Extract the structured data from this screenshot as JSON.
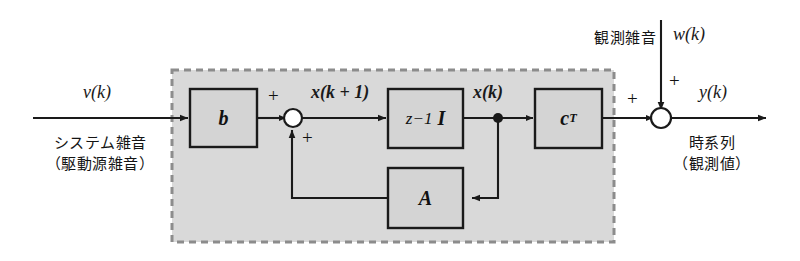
{
  "figure": {
    "type": "state-space-block-diagram",
    "title": "",
    "colors": {
      "line": "#1a1a1a",
      "block_fill": "#d4d4d4",
      "plant_fill": "#d9d9d9",
      "dashed_border": "#8c8c8c",
      "background": "#ffffff"
    }
  },
  "signals": {
    "input": "v(k)",
    "state_next": "x(k + 1)",
    "state": "x(k)",
    "measurement_noise": "w(k)",
    "output": "y(k)"
  },
  "blocks": {
    "b": "b",
    "delay_z": "z",
    "delay_exp": "−1",
    "delay_I": "I",
    "a": "A",
    "c": "c",
    "c_exp": "T"
  },
  "annotations": {
    "system_noise_line1": "システム雑音",
    "system_noise_line2": "（駆動源雑音）",
    "measurement_noise_label": "観測雑音",
    "output_line1": "時系列",
    "output_line2": "（観測値）"
  },
  "operators": {
    "sum_left_top": "+",
    "sum_left_bottom": "+",
    "sum_right_left": "+",
    "sum_right_top": "+"
  }
}
